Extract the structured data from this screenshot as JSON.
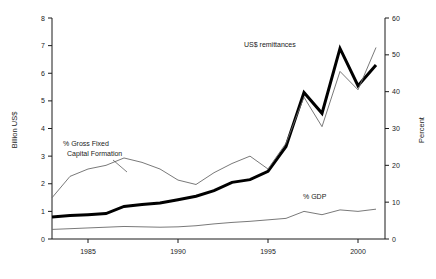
{
  "chart_data": {
    "type": "line",
    "title": "",
    "subtitle": "",
    "xlabel": "",
    "ylabel": "Billion US$",
    "y2label": "Percent",
    "xlim": [
      1983,
      2001.5
    ],
    "ylim": [
      0,
      8
    ],
    "y2lim": [
      0,
      60
    ],
    "grid": false,
    "legend_position": "inline-annotations",
    "xticks": [
      1985,
      1990,
      1995,
      2000
    ],
    "xtick_labels": [
      "1985",
      "1990",
      "1995",
      "2000"
    ],
    "yticks": [
      0,
      1,
      2,
      3,
      4,
      5,
      6,
      7,
      8
    ],
    "ytick_labels": [
      "0",
      "1",
      "2",
      "3",
      "4",
      "5",
      "6",
      "7",
      "8"
    ],
    "y2ticks": [
      0,
      10,
      20,
      30,
      40,
      50,
      60
    ],
    "y2tick_labels": [
      "0",
      "10",
      "20",
      "30",
      "40",
      "50",
      "60"
    ],
    "x": [
      1983,
      1984,
      1985,
      1986,
      1987,
      1988,
      1989,
      1990,
      1991,
      1992,
      1993,
      1994,
      1995,
      1996,
      1997,
      1998,
      1999,
      2000,
      2001
    ],
    "series": [
      {
        "name": "US$ remittances",
        "label": "US$ remittances",
        "axis": "left",
        "units": "Billion US$",
        "color": "#000000",
        "line_width": 3.0,
        "values": [
          0.8,
          0.85,
          0.88,
          0.92,
          1.18,
          1.25,
          1.3,
          1.42,
          1.55,
          1.75,
          2.05,
          2.15,
          2.45,
          3.35,
          5.3,
          4.55,
          6.9,
          5.55,
          6.3
        ]
      },
      {
        "name": "% Gross Fixed Capital Formation",
        "label": "% Gross Fixed Capital Formation",
        "axis": "right",
        "units": "Percent",
        "color": "#6a6a6a",
        "line_width": 0.9,
        "values": [
          11.2,
          17.0,
          19.0,
          20.0,
          22.0,
          20.8,
          19.0,
          16.0,
          14.8,
          18.0,
          20.5,
          22.5,
          19.0,
          26.0,
          38.5,
          30.5,
          45.5,
          40.5,
          52.0
        ]
      },
      {
        "name": "% GDP",
        "label": "% GDP",
        "axis": "right",
        "units": "Percent",
        "color": "#6a6a6a",
        "line_width": 0.9,
        "values": [
          2.6,
          2.8,
          3.0,
          3.2,
          3.4,
          3.3,
          3.2,
          3.3,
          3.6,
          4.1,
          4.5,
          4.8,
          5.2,
          5.6,
          7.5,
          6.6,
          7.9,
          7.5,
          8.1
        ]
      }
    ],
    "annotations": [
      {
        "name": "us-remittances-label",
        "text": "US$ remittances",
        "x_px": 244,
        "y_px": 47
      },
      {
        "name": "gfcf-label-line1",
        "text": "% Gross Fixed",
        "x_px": 63,
        "y_px": 146
      },
      {
        "name": "gfcf-label-line2",
        "text": "Capital Formation",
        "x_px": 63,
        "y_px": 156
      },
      {
        "name": "gdp-label",
        "text": "% GDP",
        "x_px": 303,
        "y_px": 199
      }
    ]
  }
}
